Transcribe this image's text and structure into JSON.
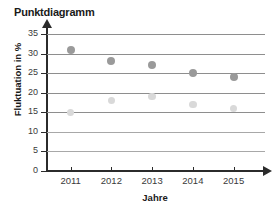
{
  "chart_data": {
    "type": "scatter",
    "title": "Punktdiagramm",
    "xlabel": "Jahre",
    "ylabel": "Fluktuation in %",
    "categories": [
      "2011",
      "2012",
      "2013",
      "2014",
      "2015"
    ],
    "x": [
      2011,
      2012,
      2013,
      2014,
      2015
    ],
    "ylim": [
      0,
      35
    ],
    "xlim": [
      2010.5,
      2015.8
    ],
    "yticks": [
      0,
      5,
      10,
      15,
      20,
      25,
      30,
      35
    ],
    "ytick_labels": [
      "0",
      "5",
      "10",
      "15",
      "20",
      "25",
      "30",
      "35"
    ],
    "grid": true,
    "grid_axis": "y",
    "legend": false,
    "series": [
      {
        "name": "dunkle Reihe",
        "color": "#9a9a9a",
        "marker": "circle",
        "values": [
          31,
          28,
          27,
          25,
          24
        ]
      },
      {
        "name": "helle Reihe",
        "color": "#d9d9d9",
        "marker": "circle",
        "values": [
          15,
          18,
          19,
          17,
          16
        ]
      }
    ],
    "colors": {
      "axis": "#2b2b2b",
      "grid": "#8e8e8e",
      "text": "#1a1a1a",
      "background": "#ffffff"
    }
  }
}
